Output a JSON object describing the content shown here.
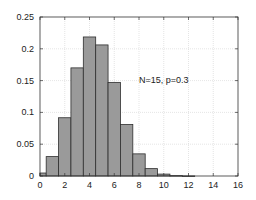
{
  "chart_data": {
    "type": "bar",
    "subtype": "histogram",
    "title": "",
    "xlabel": "",
    "ylabel": "",
    "annotation": {
      "text": "N=15, p=0.3",
      "x": 8,
      "y": 0.15
    },
    "categories": [
      0,
      1,
      2,
      3,
      4,
      5,
      6,
      7,
      8,
      9,
      10,
      11,
      12,
      13,
      14,
      15
    ],
    "values": [
      0.0047,
      0.0305,
      0.0916,
      0.17,
      0.2186,
      0.2061,
      0.1472,
      0.0811,
      0.0348,
      0.0116,
      0.003,
      0.0006,
      0.0001,
      0.0,
      0.0,
      0.0
    ],
    "bar_width": 1,
    "xlim": [
      0,
      16
    ],
    "ylim": [
      0,
      0.25
    ],
    "xticks": [
      0,
      2,
      4,
      6,
      8,
      10,
      12,
      14,
      16
    ],
    "xtick_labels": [
      "0",
      "2",
      "4",
      "6",
      "8",
      "10",
      "12",
      "14",
      "16"
    ],
    "yticks": [
      0,
      0.05,
      0.1,
      0.15,
      0.2,
      0.25
    ],
    "ytick_labels": [
      "0",
      "0.05",
      "0.1",
      "0.15",
      "0.2",
      "0.25"
    ],
    "grid": true,
    "legend": null,
    "colors": {
      "bar_fill": "#9a9a9a",
      "bar_edge": "#2e2e2e",
      "grid": "#d4d4d4",
      "axis": "#333333"
    }
  }
}
